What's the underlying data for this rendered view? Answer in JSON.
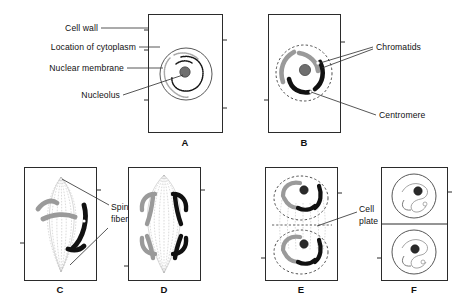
{
  "figure": {
    "title_alt": "Stages of mitosis in a plant cell",
    "background": "#ffffff",
    "ink": "#111111",
    "gray": "#9a9a9a"
  },
  "labels": {
    "cell_wall": "Cell wall",
    "location_of_cytoplasm": "Location of cytoplasm",
    "nuclear_membrane": "Nuclear membrane",
    "nucleolus": "Nucleolus",
    "chromatids": "Chromatids",
    "centromere": "Centromere",
    "spindle_fibers_line1": "Spindle",
    "spindle_fibers_line2": "fibers",
    "cell_plate_line1": "Cell",
    "cell_plate_line2": "plate"
  },
  "panels": [
    {
      "id": "A",
      "letter": "A",
      "caption": "A"
    },
    {
      "id": "B",
      "letter": "B",
      "caption": "B"
    },
    {
      "id": "C",
      "letter": "C",
      "caption": "C"
    },
    {
      "id": "D",
      "letter": "D",
      "caption": "D"
    },
    {
      "id": "E",
      "letter": "E",
      "caption": "E"
    },
    {
      "id": "F",
      "letter": "F",
      "caption": "F"
    }
  ]
}
